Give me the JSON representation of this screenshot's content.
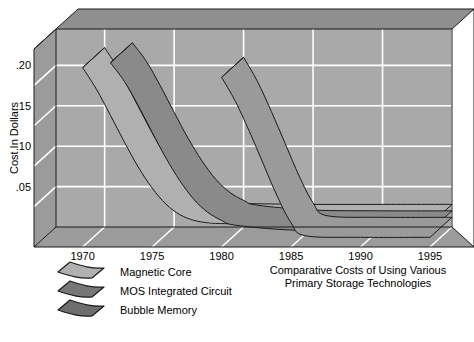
{
  "chart_data": {
    "type": "line",
    "title": "Comparative Costs of Using Various Primary Storage Technologies",
    "title_line1": "Comparative Costs of Using Various",
    "title_line2": "Primary Storage Technologies",
    "xlabel": "",
    "ylabel": "Cost In Dollars",
    "x_ticks": [
      "1970",
      "1975",
      "1980",
      "1985",
      "1990",
      "1995"
    ],
    "x_tick_values": [
      1970,
      1975,
      1980,
      1985,
      1990,
      1995
    ],
    "y_ticks": [
      ".05",
      ".10",
      ".15",
      ".20"
    ],
    "y_tick_values": [
      0.05,
      0.1,
      0.15,
      0.2
    ],
    "xlim": [
      1966.5,
      1995
    ],
    "ylim": [
      0,
      0.245
    ],
    "grid": true,
    "legend_position": "below-left",
    "style": "3d-ribbon",
    "series": [
      {
        "name": "Magnetic Core",
        "color": "#b0b0b0",
        "x": [
          1970,
          1971,
          1972,
          1973,
          1974,
          1975,
          1976,
          1977,
          1978,
          1979,
          1980,
          1985,
          1990,
          1995
        ],
        "values": [
          0.222,
          0.195,
          0.163,
          0.13,
          0.099,
          0.073,
          0.053,
          0.04,
          0.033,
          0.03,
          0.029,
          0.028,
          0.028,
          0.028
        ]
      },
      {
        "name": "MOS Integrated Circuit",
        "color": "#8a8a8a",
        "x": [
          1972,
          1973,
          1974,
          1975,
          1976,
          1977,
          1978,
          1979,
          1980,
          1981,
          1985,
          1990,
          1995
        ],
        "values": [
          0.228,
          0.205,
          0.175,
          0.142,
          0.11,
          0.082,
          0.059,
          0.043,
          0.033,
          0.027,
          0.021,
          0.02,
          0.02
        ]
      },
      {
        "name": "Bubble Memory",
        "color": "#9a9a9a",
        "x": [
          1980,
          1981,
          1982,
          1983,
          1984,
          1985,
          1986,
          1990,
          1995
        ],
        "values": [
          0.21,
          0.18,
          0.143,
          0.103,
          0.063,
          0.03,
          0.014,
          0.012,
          0.012
        ]
      }
    ]
  },
  "legend": {
    "items": [
      {
        "label": "Magnetic Core",
        "color": "#b0b0b0"
      },
      {
        "label": "MOS Integrated Circuit",
        "color": "#777777"
      },
      {
        "label": "Bubble Memory",
        "color": "#6e6e6e"
      }
    ]
  },
  "colors": {
    "wall_back": "#a9a9a9",
    "wall_left": "#9b9b9b",
    "wall_top": "#8f8f8f",
    "floor": "#9b9b9b",
    "grid": "#ffffff",
    "outline": "#1a1a1a",
    "page_background": "#ffffff"
  }
}
